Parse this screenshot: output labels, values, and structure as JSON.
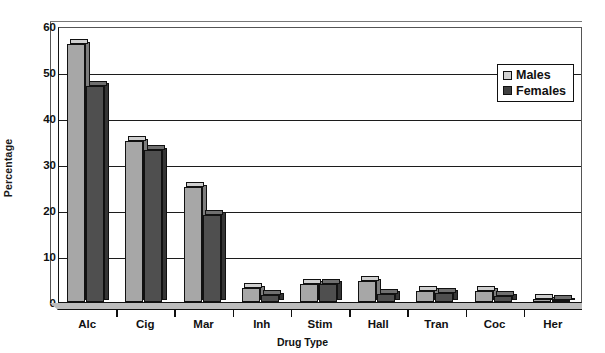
{
  "chart_data": {
    "type": "bar",
    "title": "",
    "xlabel": "Drug Type",
    "ylabel": "Percentage",
    "ylim": [
      0,
      60
    ],
    "yticks": [
      0,
      10,
      20,
      30,
      40,
      50,
      60
    ],
    "grid": true,
    "legend_position": "top-right",
    "categories": [
      "Alc",
      "Cig",
      "Mar",
      "Inh",
      "Stim",
      "Hall",
      "Tran",
      "Coc",
      "Her"
    ],
    "series": [
      {
        "name": "Males",
        "color": "#a7a7a7",
        "values": [
          56,
          35,
          25,
          3,
          4,
          4.5,
          2.5,
          2.5,
          0.6
        ]
      },
      {
        "name": "Females",
        "color": "#4f4f4f",
        "values": [
          47,
          33,
          19,
          1.5,
          4,
          1.8,
          2,
          1.3,
          0.4
        ]
      }
    ]
  },
  "legend": {
    "items": [
      {
        "label": "Males",
        "swatch": "light-gray-swatch"
      },
      {
        "label": "Females",
        "swatch": "dark-gray-swatch"
      }
    ]
  }
}
